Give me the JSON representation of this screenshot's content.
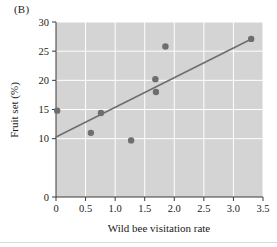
{
  "panel": {
    "label": "(B)"
  },
  "chart_data": {
    "type": "scatter",
    "title": "",
    "xlabel": "Wild bee visitation rate",
    "ylabel": "Fruit set (%)",
    "xlim": [
      0,
      3.5
    ],
    "ylim": [
      0,
      30
    ],
    "xticks": [
      "0",
      "0.5",
      "1.0",
      "1.5",
      "2.0",
      "2.5",
      "3.0",
      "3.5"
    ],
    "xtick_values": [
      0,
      0.5,
      1.0,
      1.5,
      2.0,
      2.5,
      3.0,
      3.5
    ],
    "yticks": [
      "0",
      "10",
      "15",
      "20",
      "25",
      "30"
    ],
    "ytick_values": [
      0,
      10,
      15,
      20,
      25,
      30
    ],
    "grid": true,
    "grid_color": "#ffffff",
    "plot_background": "#d4d4d4",
    "point_color": "#6e6e6e",
    "line_color": "#6e6e6e",
    "legend": "none",
    "points": [
      {
        "x": 0.02,
        "y": 14.8
      },
      {
        "x": 0.59,
        "y": 11.0
      },
      {
        "x": 0.76,
        "y": 14.4
      },
      {
        "x": 1.27,
        "y": 9.7
      },
      {
        "x": 1.68,
        "y": 20.2
      },
      {
        "x": 1.69,
        "y": 18.0
      },
      {
        "x": 1.85,
        "y": 25.8
      },
      {
        "x": 3.3,
        "y": 27.1
      }
    ],
    "series": [
      {
        "name": "Fruit set observations",
        "x": [
          0.02,
          0.59,
          0.76,
          1.27,
          1.68,
          1.69,
          1.85,
          3.3
        ],
        "values": [
          14.8,
          11.0,
          14.4,
          9.7,
          20.2,
          18.0,
          25.8,
          27.1
        ]
      }
    ],
    "trendline": {
      "type": "linear-regression",
      "x_start": 0.0,
      "y_start": 10.3,
      "x_end": 3.33,
      "y_end": 27.2,
      "slope": 5.08,
      "intercept": 10.3
    }
  }
}
